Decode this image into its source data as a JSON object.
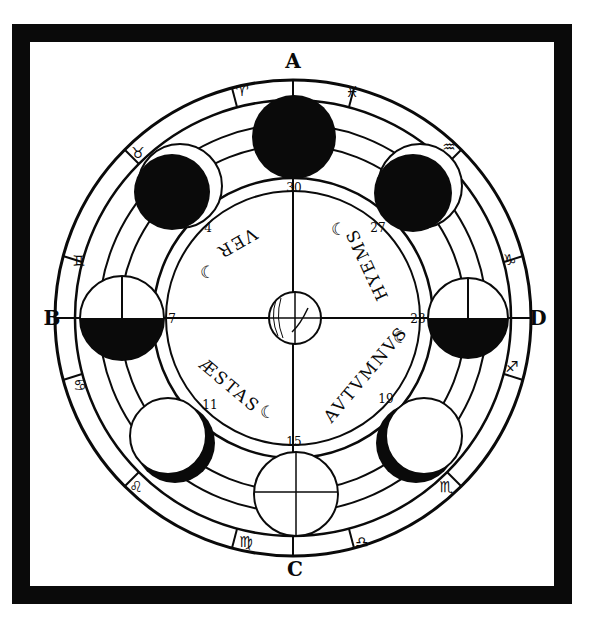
{
  "diagram": {
    "type": "woodcut-astronomical-diagram",
    "colors": {
      "ink": "#0a0a0a",
      "paper": "#ffffff"
    },
    "cardinal_labels": {
      "top": "A",
      "left": "B",
      "bottom": "C",
      "right": "D"
    },
    "zodiac_signs": [
      {
        "glyph": "♈",
        "name": "aries-icon"
      },
      {
        "glyph": "♓",
        "name": "pisces-icon"
      },
      {
        "glyph": "♒",
        "name": "aquarius-icon"
      },
      {
        "glyph": "♑",
        "name": "capricorn-icon"
      },
      {
        "glyph": "♐",
        "name": "sagittarius-icon"
      },
      {
        "glyph": "♏",
        "name": "scorpio-icon"
      },
      {
        "glyph": "♎",
        "name": "libra-icon"
      },
      {
        "glyph": "♍",
        "name": "virgo-icon"
      },
      {
        "glyph": "♌",
        "name": "leo-icon"
      },
      {
        "glyph": "♋",
        "name": "cancer-icon"
      },
      {
        "glyph": "♊",
        "name": "gemini-icon"
      },
      {
        "glyph": "♉",
        "name": "taurus-icon"
      }
    ],
    "seasons": {
      "ver": "VER",
      "hyems": "HYEMS",
      "aestas": "ÆSTAS",
      "autumnus": "AVTVMNVS"
    },
    "day_numbers": {
      "top": "30",
      "upper_left": "4",
      "upper_right": "27",
      "left": "7",
      "right": "23",
      "lower_left": "11",
      "lower_right": "19",
      "bottom": "15"
    },
    "crescent_glyph": "☾",
    "moon_phases": [
      {
        "position": "top",
        "phase": "new-moon"
      },
      {
        "position": "upper-right",
        "phase": "waxing-crescent"
      },
      {
        "position": "right",
        "phase": "first-quarter"
      },
      {
        "position": "lower-right",
        "phase": "waxing-gibbous"
      },
      {
        "position": "bottom",
        "phase": "full-moon"
      },
      {
        "position": "lower-left",
        "phase": "waning-gibbous"
      },
      {
        "position": "left",
        "phase": "last-quarter"
      },
      {
        "position": "upper-left",
        "phase": "waning-crescent"
      }
    ],
    "center": "earth"
  }
}
